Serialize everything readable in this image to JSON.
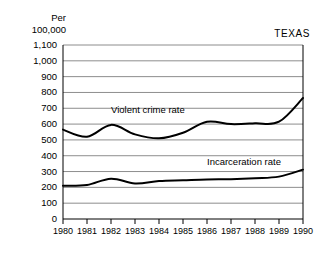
{
  "chart_data": {
    "type": "line",
    "title": "",
    "region_label": "TEXAS",
    "ylabel": "Per\n100,000",
    "xlabel": "",
    "x": [
      1980,
      1981,
      1982,
      1983,
      1984,
      1985,
      1986,
      1987,
      1988,
      1989,
      1990
    ],
    "categories": [
      "1980",
      "1981",
      "1982",
      "1983",
      "1984",
      "1985",
      "1986",
      "1987",
      "1988",
      "1989",
      "1990"
    ],
    "ylim": [
      0,
      1100
    ],
    "ytick_labels": [
      "1,100",
      "1,000",
      "900",
      "800",
      "700",
      "600",
      "500",
      "400",
      "300",
      "200",
      "100",
      "0"
    ],
    "ytick_values": [
      1100,
      1000,
      900,
      800,
      700,
      600,
      500,
      400,
      300,
      200,
      100,
      0
    ],
    "grid": true,
    "grid_color": "#808080",
    "legend": "inline-annotations",
    "series": [
      {
        "name": "Violent crime rate",
        "color": "#000000",
        "values": [
          565,
          520,
          595,
          535,
          510,
          545,
          615,
          600,
          605,
          615,
          765
        ],
        "label_x": 1982,
        "label_y": 690
      },
      {
        "name": "Incarceration rate",
        "color": "#000000",
        "values": [
          210,
          215,
          255,
          225,
          240,
          245,
          250,
          252,
          258,
          268,
          312
        ],
        "label_x": 1986,
        "label_y": 360
      }
    ]
  }
}
